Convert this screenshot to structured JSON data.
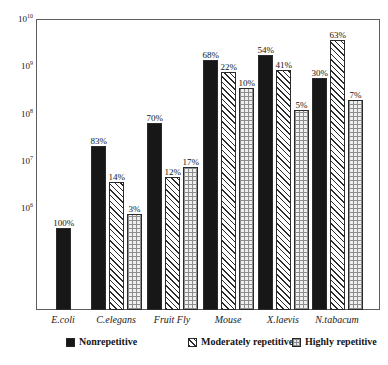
{
  "chart_data": {
    "type": "bar",
    "title": "",
    "subtitle": "",
    "xlabel": "",
    "ylabel": "",
    "yscale": "log",
    "ylim": [
      100000,
      10000000000
    ],
    "grid": false,
    "legend_position": "bottom",
    "categories": [
      "E.coli",
      "C.elegans",
      "Fruit Fly",
      "Mouse",
      "X.laevis",
      "N.tabacum"
    ],
    "y_ticks": [
      {
        "label_base": "10",
        "label_exp": "6",
        "value": 1000000
      },
      {
        "label_base": "10",
        "label_exp": "7",
        "value": 10000000
      },
      {
        "label_base": "10",
        "label_exp": "8",
        "value": 100000000
      },
      {
        "label_base": "10",
        "label_exp": "9",
        "value": 1000000000
      },
      {
        "label_base": "10",
        "label_exp": "10",
        "value": 10000000000
      }
    ],
    "series": [
      {
        "name": "Nonrepetitive",
        "pattern": "p-solid",
        "values": [
          4600000,
          78000000,
          150000000,
          1400000000,
          1800000000,
          760000000
        ],
        "labels": [
          "100%",
          "83%",
          "70%",
          "68%",
          "54%",
          "30%"
        ]
      },
      {
        "name": "Moderately repetitive",
        "pattern": "p-hatch",
        "values": [
          null,
          13000000,
          18000000,
          800000000,
          900000000,
          3000000000
        ],
        "labels": [
          null,
          "14%",
          "12%",
          "22%",
          "41%",
          "63%"
        ]
      },
      {
        "name": "Highly repetitive",
        "pattern": "p-dots",
        "values": [
          null,
          2800000,
          29000000,
          360000000,
          160000000,
          280000000
        ],
        "labels": [
          null,
          "3%",
          "17%",
          "10%",
          "5%",
          "7%"
        ]
      }
    ],
    "bars": [
      {
        "group": "E.coli",
        "series": "Nonrepetitive",
        "label": "100%",
        "pattern": "p-solid",
        "top_px": 228
      },
      {
        "group": "C.elegans",
        "series": "Nonrepetitive",
        "label": "83%",
        "pattern": "p-solid",
        "top_px": 146
      },
      {
        "group": "C.elegans",
        "series": "Moderately repetitive",
        "label": "14%",
        "pattern": "p-hatch",
        "top_px": 182
      },
      {
        "group": "C.elegans",
        "series": "Highly repetitive",
        "label": "3%",
        "pattern": "p-dots",
        "top_px": 214
      },
      {
        "group": "Fruit Fly",
        "series": "Nonrepetitive",
        "label": "70%",
        "pattern": "p-solid",
        "top_px": 123
      },
      {
        "group": "Fruit Fly",
        "series": "Moderately repetitive",
        "label": "12%",
        "pattern": "p-hatch",
        "top_px": 177
      },
      {
        "group": "Fruit Fly",
        "series": "Highly repetitive",
        "label": "17%",
        "pattern": "p-dots",
        "top_px": 167
      },
      {
        "group": "Mouse",
        "series": "Nonrepetitive",
        "label": "68%",
        "pattern": "p-solid",
        "top_px": 60
      },
      {
        "group": "Mouse",
        "series": "Moderately repetitive",
        "label": "22%",
        "pattern": "p-hatch",
        "top_px": 72
      },
      {
        "group": "Mouse",
        "series": "Highly repetitive",
        "label": "10%",
        "pattern": "p-dots",
        "top_px": 88
      },
      {
        "group": "X.laevis",
        "series": "Nonrepetitive",
        "label": "54%",
        "pattern": "p-solid",
        "top_px": 55
      },
      {
        "group": "X.laevis",
        "series": "Moderately repetitive",
        "label": "41%",
        "pattern": "p-hatch",
        "top_px": 70
      },
      {
        "group": "X.laevis",
        "series": "Highly repetitive",
        "label": "5%",
        "pattern": "p-dots",
        "top_px": 110
      },
      {
        "group": "N.tabacum",
        "series": "Nonrepetitive",
        "label": "30%",
        "pattern": "p-solid",
        "top_px": 78
      },
      {
        "group": "N.tabacum",
        "series": "Moderately repetitive",
        "label": "63%",
        "pattern": "p-hatch",
        "top_px": 40
      },
      {
        "group": "N.tabacum",
        "series": "Highly repetitive",
        "label": "7%",
        "pattern": "p-dots",
        "top_px": 100
      }
    ],
    "legend": [
      {
        "label": "Nonrepetitive",
        "pattern": "p-solid"
      },
      {
        "label": "Moderately repetitive",
        "pattern": "p-hatch"
      },
      {
        "label": "Highly repetitive",
        "pattern": "p-dots"
      }
    ]
  }
}
